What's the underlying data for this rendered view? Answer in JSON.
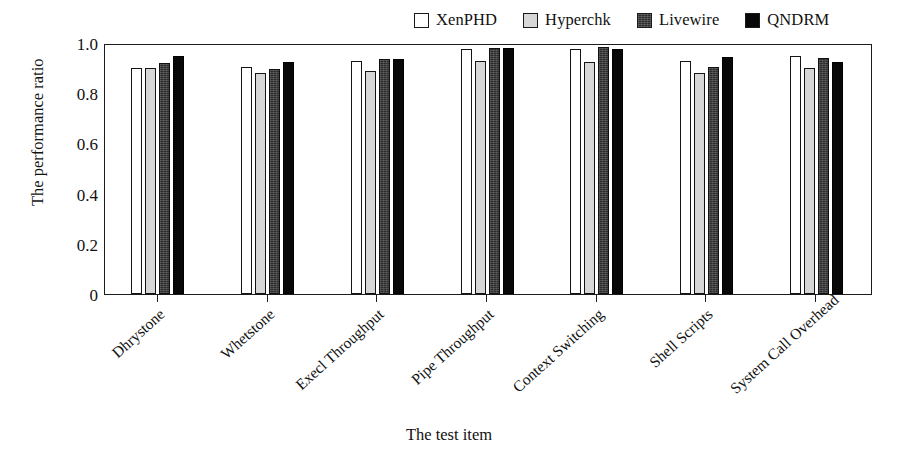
{
  "chart_data": {
    "type": "bar",
    "title": "",
    "xlabel": "The test item",
    "ylabel": "The performance ratio",
    "ylim": [
      0,
      1.0
    ],
    "yticks": [
      "0",
      "0.2",
      "0.4",
      "0.6",
      "0.8",
      "1.0"
    ],
    "ytick_values": [
      0,
      0.2,
      0.4,
      0.6,
      0.8,
      1.0
    ],
    "grid": false,
    "legend_position": "top-right",
    "categories": [
      "Dhrystone",
      "Whetstone",
      "Execl Throughput",
      "Pipe Throughput",
      "Context Switching",
      "Shell Scripts",
      "System Call Overhead"
    ],
    "series": [
      {
        "name": "XenPHD",
        "color": "#ffffff",
        "edge_color": "#141414",
        "fill": "white",
        "values": [
          0.9,
          0.905,
          0.93,
          0.975,
          0.975,
          0.93,
          0.95
        ]
      },
      {
        "name": "Hyperchk",
        "color": "#d7d7d7",
        "edge_color": "#141414",
        "fill": "light-gray",
        "values": [
          0.9,
          0.88,
          0.89,
          0.93,
          0.925,
          0.88,
          0.9
        ]
      },
      {
        "name": "Livewire",
        "color": "#2b2b2b",
        "edge_color": "#111111",
        "fill": "dark-gray-textured",
        "values": [
          0.92,
          0.895,
          0.935,
          0.98,
          0.985,
          0.905,
          0.94
        ]
      },
      {
        "name": "QNDRM",
        "color": "#080808",
        "edge_color": "#000000",
        "fill": "black",
        "values": [
          0.95,
          0.925,
          0.935,
          0.98,
          0.975,
          0.945,
          0.925
        ]
      }
    ]
  }
}
